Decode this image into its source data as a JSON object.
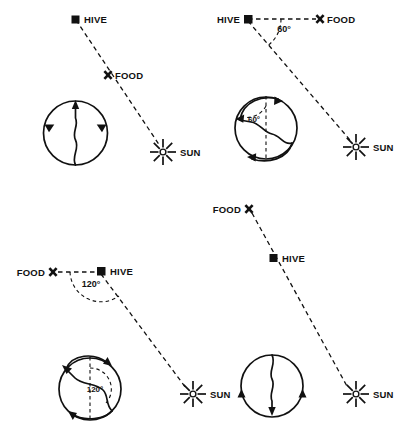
{
  "figure": {
    "background_color": "#ffffff",
    "ink_color": "#111111",
    "width": 412,
    "height": 432
  },
  "labels": {
    "hive": "HIVE",
    "food": "FOOD",
    "sun": "SUN"
  },
  "panels": [
    {
      "id": "top-left",
      "name": "food-toward-sun",
      "hive_label": "HIVE",
      "food_label": "FOOD",
      "sun_label": "SUN",
      "angle_field": null,
      "angle_dance": null,
      "waggle_direction": "up",
      "description": "Food lies directly on the line from hive to sun; dance waggle runs straight up the comb."
    },
    {
      "id": "top-right",
      "name": "food-60-degrees-left-of-sun",
      "hive_label": "HIVE",
      "food_label": "FOOD",
      "sun_label": "SUN",
      "angle_field": "60°",
      "angle_dance": "60°",
      "waggle_direction": "60 degrees left of vertical",
      "description": "Food lies 60 degrees from the sun direction; dance waggle runs 60 degrees left of vertical."
    },
    {
      "id": "bottom-left",
      "name": "food-120-degrees-left-of-sun",
      "hive_label": "HIVE",
      "food_label": "FOOD",
      "sun_label": "SUN",
      "angle_field": "120°",
      "angle_dance": "120°",
      "waggle_direction": "120 degrees left of vertical",
      "description": "Food lies 120 degrees from the sun direction; dance waggle runs 120 degrees left of vertical."
    },
    {
      "id": "bottom-right",
      "name": "food-away-from-sun",
      "hive_label": "HIVE",
      "food_label": "FOOD",
      "sun_label": "SUN",
      "angle_field": null,
      "angle_dance": null,
      "waggle_direction": "down",
      "description": "Food lies directly away from the sun; dance waggle runs straight down the comb."
    }
  ]
}
